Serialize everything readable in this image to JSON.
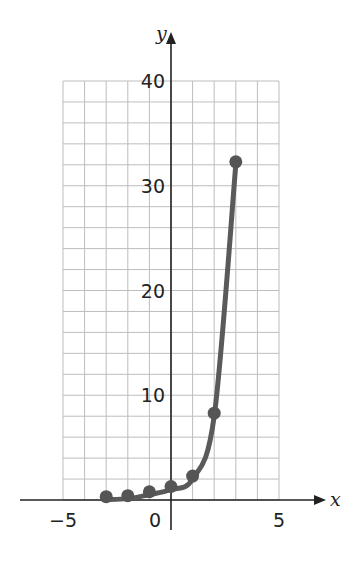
{
  "chart_data": {
    "type": "line",
    "title": "",
    "xlabel": "x",
    "ylabel": "y",
    "xlim": [
      -5,
      5
    ],
    "ylim": [
      0,
      40
    ],
    "x_ticks": [
      {
        "value": -5,
        "label": "−5"
      },
      {
        "value": 0,
        "label": "0"
      },
      {
        "value": 5,
        "label": "5"
      }
    ],
    "y_ticks": [
      {
        "value": 10,
        "label": "10"
      },
      {
        "value": 20,
        "label": "20"
      },
      {
        "value": 30,
        "label": "30"
      },
      {
        "value": 40,
        "label": "40"
      }
    ],
    "grid": {
      "on": true,
      "x_step": 1,
      "y_step": 2
    },
    "series": [
      {
        "name": "curve",
        "color": "#5a5a5a",
        "points": [
          {
            "x": -3,
            "y": 0.03
          },
          {
            "x": -2,
            "y": 0.13
          },
          {
            "x": -1,
            "y": 0.5
          },
          {
            "x": 0,
            "y": 1
          },
          {
            "x": 1,
            "y": 2
          },
          {
            "x": 2,
            "y": 8
          },
          {
            "x": 3,
            "y": 32
          }
        ]
      }
    ]
  },
  "colors": {
    "grid": "#bdbdbd",
    "axis": "#222222",
    "curve": "#5a5a5a",
    "point": "#555555"
  }
}
